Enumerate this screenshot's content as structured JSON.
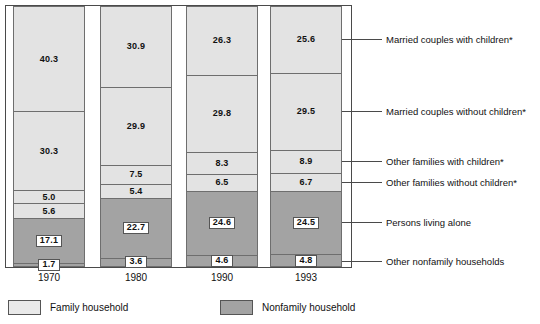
{
  "chart_data": {
    "type": "bar",
    "title": "",
    "subtitle": "",
    "xlabel": "",
    "ylabel": "",
    "stacked": true,
    "normalized": true,
    "ylim": [
      0,
      100
    ],
    "grid": false,
    "legend_position": "bottom-left",
    "categories": [
      "1970",
      "1980",
      "1990",
      "1993"
    ],
    "series": [
      {
        "name": "Married couples with children*",
        "group": "Family household",
        "color": "#e3e3e3",
        "values": [
          40.3,
          30.9,
          26.3,
          25.6
        ]
      },
      {
        "name": "Married couples without children*",
        "group": "Family household",
        "color": "#e3e3e3",
        "values": [
          30.3,
          29.9,
          29.8,
          29.5
        ]
      },
      {
        "name": "Other families with children*",
        "group": "Family household",
        "color": "#e3e3e3",
        "values": [
          5.0,
          7.5,
          8.3,
          8.9
        ]
      },
      {
        "name": "Other families without children*",
        "group": "Family household",
        "color": "#e3e3e3",
        "values": [
          5.6,
          5.4,
          6.5,
          6.7
        ]
      },
      {
        "name": "Persons living alone",
        "group": "Nonfamily household",
        "color": "#a3a3a3",
        "values": [
          17.1,
          22.7,
          24.6,
          24.5
        ]
      },
      {
        "name": "Other nonfamily households",
        "group": "Nonfamily household",
        "color": "#a3a3a3",
        "values": [
          1.7,
          3.6,
          4.6,
          4.8
        ]
      }
    ],
    "legend": [
      {
        "label": "Family household",
        "color": "#e9e9e9"
      },
      {
        "label": "Nonfamily household",
        "color": "#a3a3a3"
      }
    ]
  },
  "axis": {
    "ticks": [
      "1970",
      "1980",
      "1990",
      "1993"
    ]
  },
  "callouts": [
    {
      "label": "Married couples with children*"
    },
    {
      "label": "Married couples without children*"
    },
    {
      "label": "Other families with children*"
    },
    {
      "label": "Other families without children*"
    },
    {
      "label": "Persons living alone"
    },
    {
      "label": "Other nonfamily households"
    }
  ]
}
